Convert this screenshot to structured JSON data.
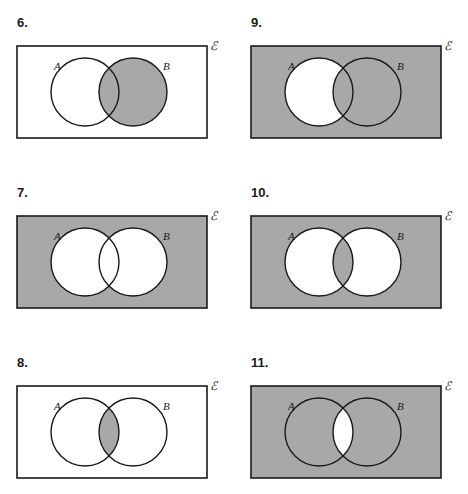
{
  "page": {
    "background_color": "#ffffff",
    "ink_color": "#1a1a1a",
    "shade_color": "#a8a8a8",
    "unshaded_color": "#ffffff"
  },
  "labels": {
    "set_a": "A",
    "set_b": "B",
    "universal_set": "ℰ"
  },
  "geometry": {
    "rect": {
      "x": 10,
      "y": 8,
      "width": 190,
      "height": 92
    },
    "circle_a": {
      "cx": 78,
      "cy": 54,
      "r": 34
    },
    "circle_b": {
      "cx": 126,
      "cy": 54,
      "r": 34
    },
    "label_a": {
      "x": 47,
      "y": 32
    },
    "label_b": {
      "x": 156,
      "y": 32
    },
    "label_universal": {
      "x": 203,
      "y": 12
    }
  },
  "diagrams": [
    {
      "number": "6.",
      "name": "diagram-6",
      "column": "left",
      "row": 1,
      "shading": {
        "outside": false,
        "a_only": false,
        "intersection": true,
        "b_only": true
      },
      "region_description": "Set B shaded"
    },
    {
      "number": "9.",
      "name": "diagram-9",
      "column": "right",
      "row": 1,
      "shading": {
        "outside": true,
        "a_only": false,
        "intersection": true,
        "b_only": true
      },
      "region_description": "Complement of A shaded"
    },
    {
      "number": "7.",
      "name": "diagram-7",
      "column": "left",
      "row": 2,
      "shading": {
        "outside": true,
        "a_only": false,
        "intersection": false,
        "b_only": false
      },
      "region_description": "Complement of A union B shaded"
    },
    {
      "number": "10.",
      "name": "diagram-10",
      "column": "right",
      "row": 2,
      "shading": {
        "outside": true,
        "a_only": false,
        "intersection": true,
        "b_only": false
      },
      "region_description": "Complement of symmetric difference shaded"
    },
    {
      "number": "8.",
      "name": "diagram-8",
      "column": "left",
      "row": 3,
      "shading": {
        "outside": false,
        "a_only": false,
        "intersection": true,
        "b_only": false
      },
      "region_description": "Intersection of A and B shaded"
    },
    {
      "number": "11.",
      "name": "diagram-11",
      "column": "right",
      "row": 3,
      "shading": {
        "outside": true,
        "a_only": true,
        "intersection": false,
        "b_only": true
      },
      "region_description": "Complement of A intersect B shaded"
    }
  ]
}
